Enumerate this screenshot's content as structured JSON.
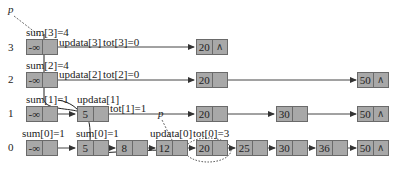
{
  "diagram": {
    "type": "skip-list-insertion",
    "pointer_label": "p",
    "levels": [
      {
        "level": "3",
        "sum_label": "sum[3]=4",
        "update_label": "updata[3]",
        "tot_label": "tot[3]=0",
        "nodes": [
          "-∞",
          "20"
        ],
        "terminal": "∧"
      },
      {
        "level": "2",
        "sum_label": "sum[2]=4",
        "update_label": "updata[2]",
        "tot_label": "tot[2]=0",
        "nodes": [
          "-∞",
          "20",
          "50"
        ],
        "terminal": "∧"
      },
      {
        "level": "1",
        "sum_label": "sum[1]=1",
        "update_label": "updata[1]",
        "tot_label": "tot[1]=1",
        "nodes": [
          "-∞",
          "5",
          "20",
          "30",
          "50"
        ],
        "terminal": "∧"
      },
      {
        "level": "0",
        "sum_label": "sum[0]=1",
        "sum_label_2": "sum[0]=1",
        "update_label": "updata[0]",
        "tot_label": "tot[0]=3",
        "nodes": [
          "-∞",
          "5",
          "8",
          "12",
          "20",
          "25",
          "30",
          "36",
          "50"
        ],
        "terminal": "∧"
      }
    ],
    "highlighted_node": "20",
    "colors": {
      "node_fill": "#a8a8a8",
      "node_border": "#6a6a6a",
      "line": "#333333"
    }
  }
}
